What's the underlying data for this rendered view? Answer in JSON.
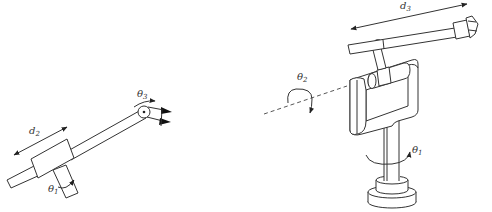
{
  "figure": {
    "left_manipulator": {
      "labels": {
        "theta1": "θ",
        "theta1_sub": "1",
        "d2": "d",
        "d2_sub": "2",
        "theta3": "θ",
        "theta3_sub": "3"
      }
    },
    "right_manipulator": {
      "labels": {
        "theta1": "θ",
        "theta1_sub": "1",
        "theta2": "θ",
        "theta2_sub": "2",
        "d3": "d",
        "d3_sub": "3"
      }
    }
  }
}
